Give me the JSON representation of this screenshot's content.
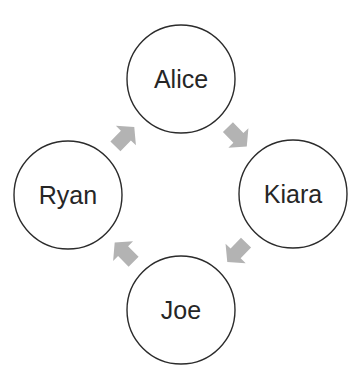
{
  "diagram": {
    "type": "cycle",
    "nodes": [
      {
        "id": "alice",
        "label": "Alice"
      },
      {
        "id": "kiara",
        "label": "Kiara"
      },
      {
        "id": "joe",
        "label": "Joe"
      },
      {
        "id": "ryan",
        "label": "Ryan"
      }
    ],
    "edges": [
      {
        "from": "alice",
        "to": "kiara"
      },
      {
        "from": "kiara",
        "to": "joe"
      },
      {
        "from": "joe",
        "to": "ryan"
      },
      {
        "from": "ryan",
        "to": "alice"
      }
    ],
    "colors": {
      "node_fill": "#ffffff",
      "node_stroke": "#2b2b2b",
      "text": "#262626",
      "arrow": "#b3b3b3"
    }
  }
}
